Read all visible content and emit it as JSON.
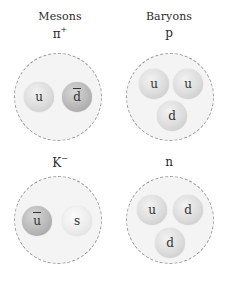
{
  "headings": {
    "mesons": "Mesons",
    "baryons": "Baryons"
  },
  "particles": [
    {
      "id": "pi-plus",
      "symbol": "π",
      "charge": "+",
      "category": "meson",
      "quarks": [
        {
          "flavor": "u",
          "anti": false
        },
        {
          "flavor": "d",
          "anti": true
        }
      ]
    },
    {
      "id": "proton",
      "symbol": "p",
      "charge": "",
      "category": "baryon",
      "quarks": [
        {
          "flavor": "u",
          "anti": false
        },
        {
          "flavor": "u",
          "anti": false
        },
        {
          "flavor": "d",
          "anti": false
        }
      ]
    },
    {
      "id": "k-minus",
      "symbol": "K",
      "charge": "−",
      "category": "meson",
      "quarks": [
        {
          "flavor": "u",
          "anti": true
        },
        {
          "flavor": "s",
          "anti": false
        }
      ]
    },
    {
      "id": "neutron",
      "symbol": "n",
      "charge": "",
      "category": "baryon",
      "quarks": [
        {
          "flavor": "u",
          "anti": false
        },
        {
          "flavor": "d",
          "anti": false
        },
        {
          "flavor": "d",
          "anti": false
        }
      ]
    }
  ],
  "colors": {
    "container_fill": "#f4f4f4",
    "container_border": "#9a9a9a",
    "quark_light": "#dcdcdc",
    "antiquark_dark": "#b8b8b8",
    "text": "#2a2a2a"
  }
}
